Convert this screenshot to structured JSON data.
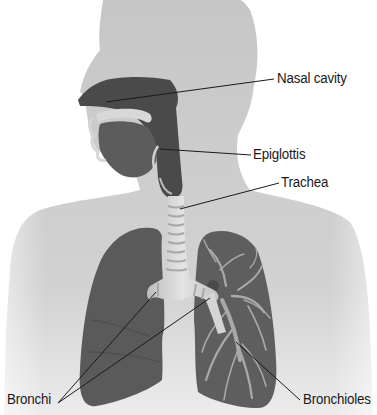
{
  "diagram": {
    "colors": {
      "body_silhouette": "#c8c8c8",
      "body_lower_fade": "#e6e6e6",
      "airway_dark": "#4a4a4a",
      "lung": "#5a5a5a",
      "cartilage": "#dcdcdc",
      "bronchiole_branches": "#a9a9a9",
      "leader_line": "#1a1a1a",
      "label_text": "#1a1a1a"
    },
    "labels": [
      {
        "id": "nasal-cavity",
        "text": "Nasal cavity",
        "x": 277,
        "y": 70
      },
      {
        "id": "epiglottis",
        "text": "Epiglottis",
        "x": 253,
        "y": 146
      },
      {
        "id": "trachea",
        "text": "Trachea",
        "x": 281,
        "y": 174
      },
      {
        "id": "bronchi",
        "text": "Bronchi",
        "x": 7,
        "y": 385
      },
      {
        "id": "bronchioles",
        "text": "Bronchioles",
        "x": 303,
        "y": 385
      }
    ]
  }
}
